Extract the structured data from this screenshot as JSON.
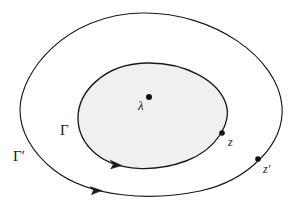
{
  "figure": {
    "type": "complex-analysis-contour-diagram",
    "background_color": "#ffffff",
    "stroke_color": "#1a1a1a",
    "region_fill_color": "#f0f0f0",
    "width": 294,
    "height": 208,
    "labels": {
      "outer_contour": "Γ′",
      "inner_contour": "Γ",
      "center_point": "λ",
      "inner_point": "z",
      "outer_point": "z′"
    },
    "points": [
      {
        "name": "lambda",
        "label": "λ",
        "x": 149,
        "y": 97,
        "radius": 3.0
      },
      {
        "name": "z",
        "label": "z",
        "x": 222,
        "y": 133,
        "radius": 2.8
      },
      {
        "name": "z-prime",
        "label": "z′",
        "x": 258,
        "y": 159,
        "radius": 2.8
      }
    ],
    "contours": [
      {
        "name": "outer-contour",
        "label": "Γ′",
        "orientation": "counterclockwise",
        "extents": {
          "left": 20,
          "right": 282,
          "top": 13,
          "bottom": 195
        },
        "arrow_at": {
          "x": 96,
          "y": 189
        }
      },
      {
        "name": "inner-contour",
        "label": "Γ",
        "orientation": "counterclockwise",
        "filled": true,
        "extents": {
          "left": 78,
          "right": 227,
          "top": 63,
          "bottom": 168
        },
        "arrow_at": {
          "x": 116,
          "y": 163
        }
      }
    ]
  }
}
